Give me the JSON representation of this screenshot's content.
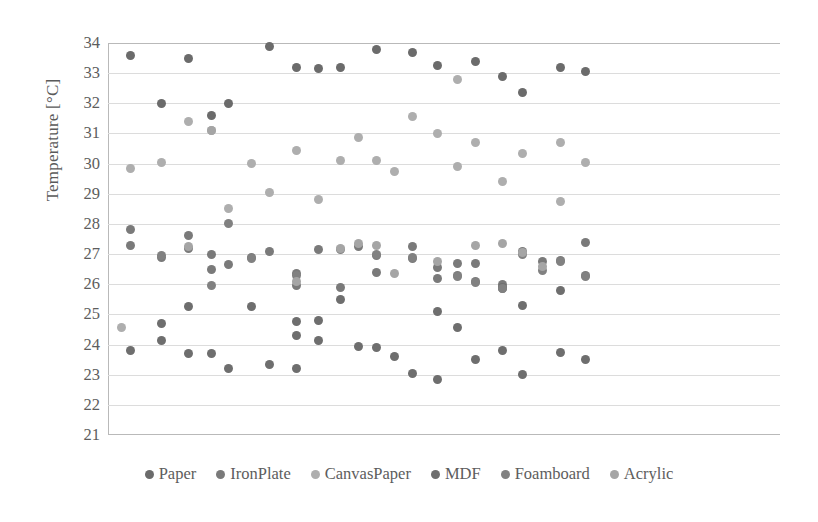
{
  "chart_data": {
    "type": "scatter",
    "title": "",
    "xlabel": "",
    "ylabel": "Temperature [°C]",
    "ylim": [
      21,
      34
    ],
    "yticks": [
      34,
      33,
      32,
      31,
      30,
      29,
      28,
      27,
      26,
      25,
      24,
      23,
      22,
      21
    ],
    "grid": true,
    "xaxis_visible": false,
    "legend_position": "bottom",
    "xlim": [
      0,
      30
    ],
    "series": [
      {
        "name": "Paper",
        "color": "#6b6b6b",
        "points": [
          {
            "x": 1,
            "y": 33.6
          },
          {
            "x": 2.4,
            "y": 32.0
          },
          {
            "x": 3.6,
            "y": 33.5
          },
          {
            "x": 4.6,
            "y": 31.6
          },
          {
            "x": 5.4,
            "y": 32.0
          },
          {
            "x": 7.2,
            "y": 33.9
          },
          {
            "x": 8.4,
            "y": 33.2
          },
          {
            "x": 9.4,
            "y": 33.15
          },
          {
            "x": 10.4,
            "y": 33.2
          },
          {
            "x": 12.0,
            "y": 33.8
          },
          {
            "x": 13.6,
            "y": 33.7
          },
          {
            "x": 14.7,
            "y": 33.25
          },
          {
            "x": 16.4,
            "y": 33.4
          },
          {
            "x": 17.6,
            "y": 32.9
          },
          {
            "x": 18.5,
            "y": 32.35
          },
          {
            "x": 20.2,
            "y": 33.2
          },
          {
            "x": 21.3,
            "y": 33.05
          }
        ]
      },
      {
        "name": "IronPlate",
        "color": "#7a7a7a",
        "points": [
          {
            "x": 1.0,
            "y": 27.8
          },
          {
            "x": 1.0,
            "y": 27.3
          },
          {
            "x": 2.4,
            "y": 26.9
          },
          {
            "x": 3.6,
            "y": 27.6
          },
          {
            "x": 3.6,
            "y": 27.2
          },
          {
            "x": 4.6,
            "y": 27.0
          },
          {
            "x": 4.6,
            "y": 26.5
          },
          {
            "x": 5.4,
            "y": 26.65
          },
          {
            "x": 6.4,
            "y": 26.9
          },
          {
            "x": 7.2,
            "y": 27.1
          },
          {
            "x": 8.4,
            "y": 26.35
          },
          {
            "x": 8.4,
            "y": 25.95
          },
          {
            "x": 9.4,
            "y": 27.15
          },
          {
            "x": 10.4,
            "y": 25.9
          },
          {
            "x": 11.2,
            "y": 27.25
          },
          {
            "x": 12.0,
            "y": 26.95
          },
          {
            "x": 12.0,
            "y": 26.4
          },
          {
            "x": 13.6,
            "y": 27.25
          },
          {
            "x": 13.6,
            "y": 26.85
          },
          {
            "x": 14.7,
            "y": 26.55
          },
          {
            "x": 14.7,
            "y": 26.2
          },
          {
            "x": 15.6,
            "y": 26.7
          },
          {
            "x": 15.6,
            "y": 26.3
          },
          {
            "x": 16.4,
            "y": 26.7
          },
          {
            "x": 16.4,
            "y": 26.1
          },
          {
            "x": 17.6,
            "y": 26.0
          },
          {
            "x": 17.6,
            "y": 25.85
          },
          {
            "x": 18.5,
            "y": 27.1
          },
          {
            "x": 19.4,
            "y": 26.75
          },
          {
            "x": 20.2,
            "y": 26.8
          },
          {
            "x": 21.3,
            "y": 27.4
          },
          {
            "x": 21.3,
            "y": 26.3
          }
        ]
      },
      {
        "name": "CanvasPaper",
        "color": "#aeaeae",
        "points": [
          {
            "x": 0.6,
            "y": 24.55
          },
          {
            "x": 1.0,
            "y": 29.85
          },
          {
            "x": 2.4,
            "y": 30.05
          },
          {
            "x": 3.6,
            "y": 31.4
          },
          {
            "x": 4.6,
            "y": 31.1
          },
          {
            "x": 5.4,
            "y": 28.5
          },
          {
            "x": 6.4,
            "y": 30.0
          },
          {
            "x": 7.2,
            "y": 29.05
          },
          {
            "x": 8.4,
            "y": 30.45
          },
          {
            "x": 9.4,
            "y": 28.8
          },
          {
            "x": 10.4,
            "y": 30.1
          },
          {
            "x": 11.2,
            "y": 30.85
          },
          {
            "x": 12.0,
            "y": 30.1
          },
          {
            "x": 12.8,
            "y": 29.75
          },
          {
            "x": 13.6,
            "y": 31.55
          },
          {
            "x": 14.7,
            "y": 31.0
          },
          {
            "x": 15.6,
            "y": 32.8
          },
          {
            "x": 15.6,
            "y": 29.9
          },
          {
            "x": 16.4,
            "y": 30.7
          },
          {
            "x": 17.6,
            "y": 29.4
          },
          {
            "x": 18.5,
            "y": 30.35
          },
          {
            "x": 20.2,
            "y": 30.7
          },
          {
            "x": 20.2,
            "y": 28.75
          },
          {
            "x": 21.3,
            "y": 30.05
          }
        ]
      },
      {
        "name": "MDF",
        "color": "#6e6e6e",
        "points": [
          {
            "x": 1.0,
            "y": 23.8
          },
          {
            "x": 2.4,
            "y": 24.7
          },
          {
            "x": 2.4,
            "y": 24.15
          },
          {
            "x": 3.6,
            "y": 25.25
          },
          {
            "x": 3.6,
            "y": 23.7
          },
          {
            "x": 4.6,
            "y": 23.7
          },
          {
            "x": 5.4,
            "y": 23.2
          },
          {
            "x": 6.4,
            "y": 25.25
          },
          {
            "x": 7.2,
            "y": 23.35
          },
          {
            "x": 8.4,
            "y": 23.2
          },
          {
            "x": 8.4,
            "y": 24.75
          },
          {
            "x": 8.4,
            "y": 24.3
          },
          {
            "x": 9.4,
            "y": 24.8
          },
          {
            "x": 9.4,
            "y": 24.15
          },
          {
            "x": 10.4,
            "y": 25.5
          },
          {
            "x": 11.2,
            "y": 23.95
          },
          {
            "x": 12.0,
            "y": 23.9
          },
          {
            "x": 12.8,
            "y": 23.6
          },
          {
            "x": 13.6,
            "y": 23.05
          },
          {
            "x": 14.7,
            "y": 22.85
          },
          {
            "x": 14.7,
            "y": 25.1
          },
          {
            "x": 15.6,
            "y": 24.55
          },
          {
            "x": 16.4,
            "y": 23.5
          },
          {
            "x": 17.6,
            "y": 23.8
          },
          {
            "x": 17.6,
            "y": 25.9
          },
          {
            "x": 18.5,
            "y": 23.0
          },
          {
            "x": 18.5,
            "y": 25.3
          },
          {
            "x": 20.2,
            "y": 23.75
          },
          {
            "x": 20.2,
            "y": 25.8
          },
          {
            "x": 21.3,
            "y": 23.5
          }
        ]
      },
      {
        "name": "Foamboard",
        "color": "#818181",
        "points": [
          {
            "x": 5.4,
            "y": 28.0
          },
          {
            "x": 4.6,
            "y": 25.95
          },
          {
            "x": 2.4,
            "y": 26.95
          },
          {
            "x": 6.4,
            "y": 26.85
          },
          {
            "x": 8.4,
            "y": 26.3
          },
          {
            "x": 10.4,
            "y": 27.15
          },
          {
            "x": 12.0,
            "y": 27.0
          },
          {
            "x": 13.6,
            "y": 26.9
          },
          {
            "x": 15.6,
            "y": 26.25
          },
          {
            "x": 16.4,
            "y": 26.05
          },
          {
            "x": 17.6,
            "y": 25.85
          },
          {
            "x": 18.5,
            "y": 27.0
          },
          {
            "x": 19.4,
            "y": 26.45
          },
          {
            "x": 20.2,
            "y": 26.75
          },
          {
            "x": 21.3,
            "y": 26.25
          }
        ]
      },
      {
        "name": "Acrylic",
        "color": "#a5a5a5",
        "points": [
          {
            "x": 3.6,
            "y": 27.25
          },
          {
            "x": 4.6,
            "y": 31.1
          },
          {
            "x": 8.4,
            "y": 26.1
          },
          {
            "x": 10.4,
            "y": 27.2
          },
          {
            "x": 11.2,
            "y": 27.35
          },
          {
            "x": 12.0,
            "y": 27.3
          },
          {
            "x": 12.8,
            "y": 26.35
          },
          {
            "x": 14.7,
            "y": 26.75
          },
          {
            "x": 16.4,
            "y": 27.3
          },
          {
            "x": 17.6,
            "y": 27.35
          },
          {
            "x": 18.5,
            "y": 27.05
          },
          {
            "x": 19.4,
            "y": 26.6
          }
        ]
      }
    ]
  },
  "legend": {
    "items": [
      {
        "label": "Paper",
        "color": "#6b6b6b"
      },
      {
        "label": "IronPlate",
        "color": "#7a7a7a"
      },
      {
        "label": "CanvasPaper",
        "color": "#aeaeae"
      },
      {
        "label": "MDF",
        "color": "#6e6e6e"
      },
      {
        "label": "Foamboard",
        "color": "#818181"
      },
      {
        "label": "Acrylic",
        "color": "#a5a5a5"
      }
    ]
  },
  "axis": {
    "y_title": "Temperature [°C]"
  }
}
